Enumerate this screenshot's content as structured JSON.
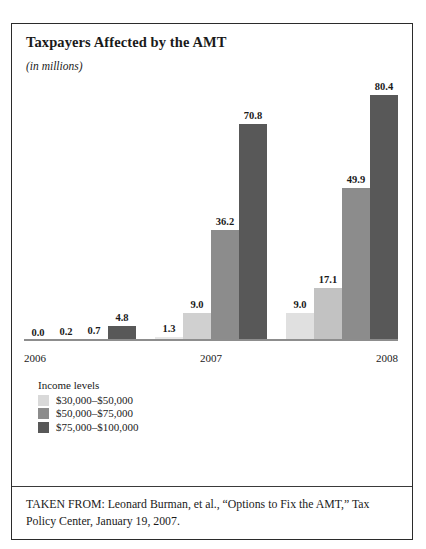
{
  "chart_data": {
    "type": "bar",
    "title": "Taxpayers Affected by the AMT",
    "subtitle": "(in millions)",
    "xlabel": "",
    "ylabel": "",
    "ylim": [
      0,
      88
    ],
    "grid": false,
    "legend_position": "below-plot-left",
    "categories": [
      "2006",
      "2007",
      "2008"
    ],
    "series": [
      {
        "name": "series-1",
        "legend_label": "",
        "color": "#e8e8e8",
        "values": [
          0.0,
          1.3,
          9.0
        ],
        "labels": [
          "0.0",
          "1.3",
          "9.0"
        ]
      },
      {
        "name": "$30,000–$50,000",
        "legend_label": "$30,000–$50,000",
        "color": "#d0d0d0",
        "values": [
          0.2,
          9.0,
          17.1
        ],
        "labels": [
          "0.2",
          "9.0",
          "17.1"
        ]
      },
      {
        "name": "$50,000–$75,000",
        "legend_label": "$50,000–$75,000",
        "color": "#8c8c8c",
        "values": [
          0.7,
          36.2,
          49.9
        ],
        "labels": [
          "0.7",
          "36.2",
          "49.9"
        ]
      },
      {
        "name": "$75,000–$100,000",
        "legend_label": "$75,000–$100,000",
        "color": "#585858",
        "values": [
          4.8,
          70.8,
          80.4
        ],
        "labels": [
          "4.8",
          "70.8",
          "80.4"
        ]
      }
    ]
  },
  "legend": {
    "title": "Income levels",
    "items": [
      {
        "label": "$30,000–$50,000",
        "color": "#d9d9d9"
      },
      {
        "label": "$50,000–$75,000",
        "color": "#8c8c8c"
      },
      {
        "label": "$75,000–$100,000",
        "color": "#585858"
      }
    ]
  },
  "source": {
    "text": "TAKEN FROM: Leonard Burman, et al., “Options to Fix the AMT,” Tax Policy Center, January 19, 2007."
  },
  "bars": {
    "g2006": [
      {
        "label": "0.0",
        "color": "#e8e8e8",
        "value": 0.0
      },
      {
        "label": "0.2",
        "color": "#d0d0d0",
        "value": 0.2
      },
      {
        "label": "0.7",
        "color": "#8c8c8c",
        "value": 0.7
      },
      {
        "label": "4.8",
        "color": "#585858",
        "value": 4.8
      }
    ],
    "g2007": [
      {
        "label": "1.3",
        "color": "#e8e8e8",
        "value": 1.3
      },
      {
        "label": "9.0",
        "color": "#d0d0d0",
        "value": 9.0
      },
      {
        "label": "36.2",
        "color": "#8c8c8c",
        "value": 36.2
      },
      {
        "label": "70.8",
        "color": "#585858",
        "value": 70.8
      }
    ],
    "g2008": [
      {
        "label": "9.0",
        "color": "#e0e0e0",
        "value": 9.0
      },
      {
        "label": "17.1",
        "color": "#c2c2c2",
        "value": 17.1
      },
      {
        "label": "49.9",
        "color": "#8c8c8c",
        "value": 49.9
      },
      {
        "label": "80.4",
        "color": "#585858",
        "value": 80.4
      }
    ]
  }
}
